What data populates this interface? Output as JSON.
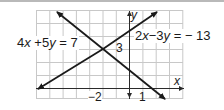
{
  "figure": {
    "equations": [
      {
        "id": "line1",
        "text_parts": [
          "4",
          "x",
          " +5",
          "y",
          " = 7"
        ],
        "display": "4x +5y = 7"
      },
      {
        "id": "line2",
        "text_parts": [
          "2",
          "x",
          "−",
          "3",
          "y",
          " = − 13"
        ],
        "display": "2x−3y = − 13"
      }
    ],
    "axes": {
      "x_label": "x",
      "y_label": "y"
    },
    "tick_labels": {
      "x_neg2": "−2",
      "x_1": "1",
      "y_3": "3"
    },
    "intersection": {
      "x": -2,
      "y": 3
    },
    "grid": {
      "x_min": -7,
      "x_max": 4,
      "y_min": -1,
      "y_max": 6,
      "cell_px": 13.3
    },
    "colors": {
      "line": "#1a1a1a",
      "grid": "#c8c8c8",
      "axis": "#2a2a2a",
      "topbar": "#b9b9b9"
    }
  }
}
